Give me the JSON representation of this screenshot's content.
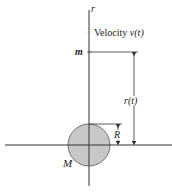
{
  "diagram": {
    "axis_label": "r",
    "velocity_label": "Velocity",
    "velocity_symbol": "v(t)",
    "mass_small": "m",
    "distance_label": "r(t)",
    "radius_label": "R",
    "mass_large": "M",
    "colors": {
      "line": "#333333",
      "sphere_fill": "#c8c8c8",
      "sphere_stroke": "#555555"
    }
  }
}
